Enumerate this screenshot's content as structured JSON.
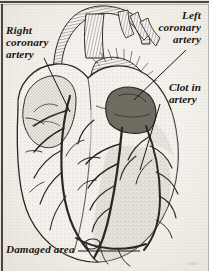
{
  "figure": {
    "type": "anatomical-illustration",
    "style": "engraving-hatched-line-drawing",
    "background_color": "#f3f1ec",
    "ink_color": "#17150f"
  },
  "labels": {
    "right_coronary_artery": {
      "lines": [
        "Right",
        "coronary",
        "artery"
      ],
      "position": "top-left",
      "has_leader_line": true
    },
    "left_coronary_artery": {
      "lines": [
        "Left",
        "coronary",
        "artery"
      ],
      "position": "top-right",
      "has_leader_line": true
    },
    "clot_in_artery": {
      "lines": [
        "Clot in",
        "artery"
      ],
      "position": "right",
      "has_leader_line": true
    },
    "damaged_area": {
      "lines": [
        "Damaged area"
      ],
      "position": "bottom-left",
      "has_leader_line": true
    }
  },
  "regions": {
    "clot": {
      "name": "clot-in-artery",
      "shading": "dark-stipple",
      "color": "#5b564c"
    },
    "damaged": {
      "name": "damaged-area",
      "shading": "grey-tint",
      "color": "#a9a49a"
    },
    "aorta": {
      "name": "aorta",
      "shading": "fine-hatching"
    },
    "pulmonary_trunk": {
      "name": "pulmonary-trunk",
      "shading": "fine-hatching"
    },
    "right_atrium": {
      "name": "right-atrial-appendage",
      "shading": "stipple"
    },
    "ventricles": {
      "name": "ventricles",
      "shading": "light-stipple"
    }
  }
}
